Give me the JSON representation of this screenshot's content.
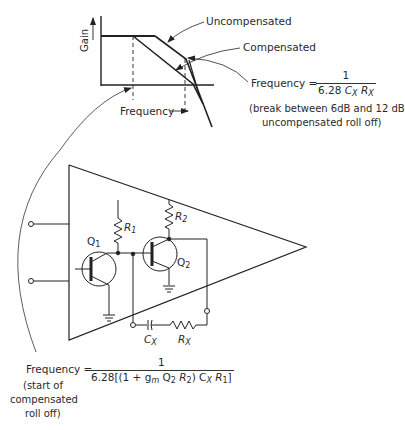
{
  "bode_plot": {
    "y_axis_label": "Gain",
    "x_axis_label": "Frequency",
    "curves": [
      {
        "name": "Uncompensated",
        "label": "Uncompensated"
      },
      {
        "name": "Compensated",
        "label": "Compensated"
      }
    ]
  },
  "annotations": {
    "break_frequency": {
      "prefix": "Frequency =",
      "numerator": "1",
      "denominator_const": "6.28",
      "denominator_c": "C",
      "denominator_c_sub": "X",
      "denominator_r": "R",
      "denominator_r_sub": "X",
      "note_line1": "(break between 6dB and 12 dB",
      "note_line2": "uncompensated roll off)"
    },
    "compensated_start": {
      "prefix": "Frequency =",
      "numerator": "1",
      "denominator": "6.28[(1 + g",
      "denominator_gm_sub": "m",
      "denominator_mid": " Q",
      "denominator_q_sub": "2",
      "denominator_r2": " R",
      "denominator_r2_sub": "2",
      "denominator_tail": ") C",
      "denominator_cx_sub": "X",
      "denominator_r1": " R",
      "denominator_r1_sub": "1",
      "denominator_close": "]",
      "note_line1": "(start of",
      "note_line2": "compensated",
      "note_line3": "roll off)"
    }
  },
  "circuit": {
    "components": {
      "q1": "Q",
      "q1_sub": "1",
      "q2": "Q",
      "q2_sub": "2",
      "r1": "R",
      "r1_sub": "1",
      "r2": "R",
      "r2_sub": "2",
      "cx": "C",
      "cx_sub": "X",
      "rx": "R",
      "rx_sub": "X"
    }
  }
}
